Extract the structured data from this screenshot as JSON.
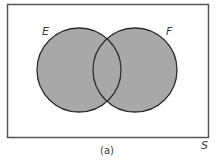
{
  "diagram": {
    "type": "venn",
    "sample_space": {
      "label": "S",
      "frame": {
        "x": 7,
        "y": 4,
        "width": 201,
        "height": 133
      }
    },
    "sets": [
      {
        "label": "E",
        "cx": 79,
        "cy": 70,
        "r": 42
      },
      {
        "label": "F",
        "cx": 135,
        "cy": 70,
        "r": 42
      }
    ],
    "shaded_region": "E ∪ F",
    "caption": "(a)",
    "colors": {
      "fill": "#a8a8a8",
      "stroke": "#2e2e2e",
      "frame": "#555555",
      "background": "#ffffff",
      "text": "#3a3a3a"
    }
  }
}
